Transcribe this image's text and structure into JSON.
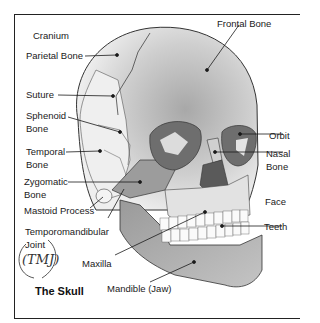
{
  "diagram": {
    "title": "The Skull",
    "handwritten_note": "(TMJ)",
    "labels": {
      "cranium": "Cranium",
      "parietal_bone": "Parietal Bone",
      "suture": "Suture",
      "sphenoid_bone_1": "Sphenoid",
      "sphenoid_bone_2": "Bone",
      "temporal_bone_1": "Temporal",
      "temporal_bone_2": "Bone",
      "zygomatic_bone_1": "Zygomatic",
      "zygomatic_bone_2": "Bone",
      "mastoid_process": "Mastoid Process",
      "tmj_1": "Temporomandibular",
      "tmj_2": "Joint",
      "maxilla": "Maxilla",
      "mandible": "Mandible (Jaw)",
      "frontal_bone": "Frontal Bone",
      "orbit": "Orbit",
      "nasal_bone_1": "Nasal",
      "nasal_bone_2": "Bone",
      "face": "Face",
      "teeth": "Teeth"
    },
    "colors": {
      "bone_light": "#e8e8e8",
      "bone_mid": "#bdbdbd",
      "bone_dark": "#8f8f8f",
      "orbit": "#6e6e6e",
      "line": "#1a1a1a"
    }
  }
}
